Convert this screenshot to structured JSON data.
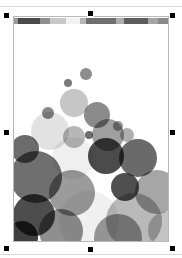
{
  "app": {
    "canvas_background": "#ffffff",
    "page_background": "#ffffff",
    "page_border_color": "#b9b9b9",
    "selection_handle_color": "#000000",
    "selection_handle_count": 8
  },
  "page_object": {
    "name": "selected-image-object",
    "x": 13,
    "y": 16,
    "width": 156,
    "height": 226,
    "selected": true
  },
  "header_strip": {
    "name": "blurred-toolbar-strip",
    "segments": [
      {
        "width": 4,
        "color": "#9a9a9a"
      },
      {
        "width": 22,
        "color": "#4a4a4a"
      },
      {
        "width": 10,
        "color": "#8f8f8f"
      },
      {
        "width": 16,
        "color": "#c8c8c8"
      },
      {
        "width": 14,
        "color": "#f2f2f2"
      },
      {
        "width": 6,
        "color": "#b5b5b5"
      },
      {
        "width": 30,
        "color": "#6f6f6f"
      },
      {
        "width": 8,
        "color": "#aeaeae"
      },
      {
        "width": 24,
        "color": "#5c5c5c"
      },
      {
        "width": 10,
        "color": "#a5a5a5"
      },
      {
        "width": 12,
        "color": "#8a8a8a"
      }
    ]
  },
  "selection_handles": [
    {
      "name": "handle-top-left",
      "x": 4,
      "y": 13
    },
    {
      "name": "handle-top-center",
      "x": 88,
      "y": 11
    },
    {
      "name": "handle-top-right",
      "x": 170,
      "y": 13
    },
    {
      "name": "handle-middle-left",
      "x": 4,
      "y": 130
    },
    {
      "name": "handle-middle-right",
      "x": 170,
      "y": 130
    },
    {
      "name": "handle-bottom-left",
      "x": 4,
      "y": 246
    },
    {
      "name": "handle-bottom-center",
      "x": 88,
      "y": 247
    },
    {
      "name": "handle-bottom-right",
      "x": 170,
      "y": 246
    }
  ],
  "chart_data": {
    "type": "scatter",
    "title": "",
    "subtitle": "",
    "xlabel": "",
    "ylabel": "",
    "xlim": [
      0,
      156
    ],
    "ylim": [
      0,
      218
    ],
    "grid": false,
    "legend": null,
    "palette": [
      "#3f3f3f",
      "#555555",
      "#6b6b6b",
      "#7f7f7f",
      "#949494",
      "#a8a8a8",
      "#bcbcbc",
      "#d2d2d2",
      "#e6e6e6",
      "#f0f0f0"
    ],
    "series": [
      {
        "name": "bubbles",
        "points": [
          {
            "cx": 72,
            "cy": 49,
            "r": 6,
            "color": "#8d8d8d"
          },
          {
            "cx": 54,
            "cy": 58,
            "r": 4,
            "color": "#7b7b7b"
          },
          {
            "cx": 60,
            "cy": 78,
            "r": 14,
            "color": "#c6c6c6"
          },
          {
            "cx": 34,
            "cy": 88,
            "r": 6,
            "color": "#858585"
          },
          {
            "cx": 83,
            "cy": 90,
            "r": 13,
            "color": "#8b8b8b"
          },
          {
            "cx": 104,
            "cy": 101,
            "r": 5,
            "color": "#9a9a9a"
          },
          {
            "cx": 94,
            "cy": 110,
            "r": 16,
            "color": "#9f9f9f"
          },
          {
            "cx": 113,
            "cy": 110,
            "r": 7,
            "color": "#b0b0b0"
          },
          {
            "cx": 75,
            "cy": 110,
            "r": 4,
            "color": "#6e6e6e"
          },
          {
            "cx": 36,
            "cy": 106,
            "r": 19,
            "color": "#e2e2e2"
          },
          {
            "cx": 60,
            "cy": 112,
            "r": 11,
            "color": "#b7b7b7"
          },
          {
            "cx": 11,
            "cy": 124,
            "r": 14,
            "color": "#6c6c6c"
          },
          {
            "cx": 59,
            "cy": 133,
            "r": 21,
            "color": "#efefef"
          },
          {
            "cx": 92,
            "cy": 131,
            "r": 18,
            "color": "#4b4b4b"
          },
          {
            "cx": 124,
            "cy": 133,
            "r": 19,
            "color": "#6a6a6a"
          },
          {
            "cx": 22,
            "cy": 152,
            "r": 26,
            "color": "#6f6f6f"
          },
          {
            "cx": 58,
            "cy": 168,
            "r": 23,
            "color": "#9b9b9b"
          },
          {
            "cx": 111,
            "cy": 162,
            "r": 14,
            "color": "#4f4f4f"
          },
          {
            "cx": 143,
            "cy": 167,
            "r": 22,
            "color": "#a6a6a6"
          },
          {
            "cx": 20,
            "cy": 190,
            "r": 21,
            "color": "#4d4d4d"
          },
          {
            "cx": 75,
            "cy": 196,
            "r": 30,
            "color": "#f0f0f0"
          },
          {
            "cx": 120,
            "cy": 196,
            "r": 28,
            "color": "#b9b9b9"
          },
          {
            "cx": 47,
            "cy": 206,
            "r": 22,
            "color": "#8e8e8e"
          },
          {
            "cx": 152,
            "cy": 205,
            "r": 18,
            "color": "#c4c4c4"
          },
          {
            "cx": 104,
            "cy": 213,
            "r": 24,
            "color": "#9d9d9d"
          },
          {
            "cx": 8,
            "cy": 212,
            "r": 16,
            "color": "#3f3f3f"
          }
        ]
      }
    ]
  }
}
